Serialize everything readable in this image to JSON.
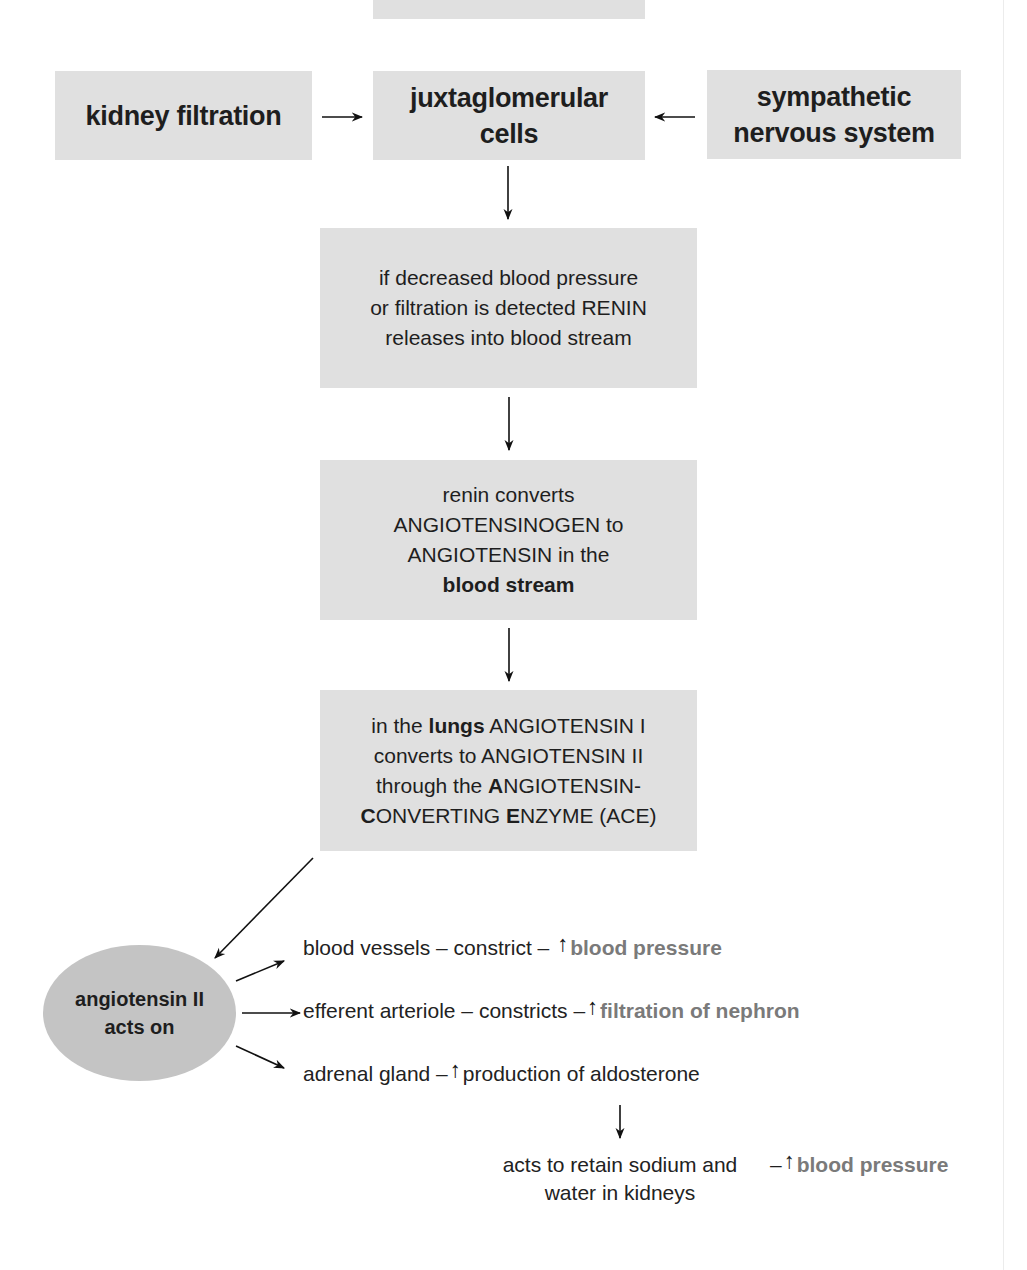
{
  "diagram": {
    "colors": {
      "box_fill": "#e0e0e0",
      "ellipse_fill": "#c4c4c4",
      "outcome_text": "#7a7a7a",
      "text": "#1e1e1e"
    },
    "top_partial_box": {
      "label": ""
    },
    "inputs": {
      "left": {
        "label": "kidney filtration"
      },
      "center": {
        "line1": "juxtaglomerular",
        "line2": "cells"
      },
      "right": {
        "line1": "sympathetic",
        "line2": "nervous system"
      }
    },
    "steps": [
      {
        "lines": [
          "if decreased blood pressure",
          "or filtration is detected RENIN",
          "releases into blood stream"
        ]
      },
      {
        "line1": "renin converts",
        "line2": "ANGIOTENSINOGEN to",
        "line3": "ANGIOTENSIN in the",
        "line4_bold": "blood stream"
      },
      {
        "l1_pre": "in the ",
        "l1_bold": "lungs",
        "l1_post": " ANGIOTENSIN I",
        "l2": "converts to ANGIOTENSIN II",
        "l3_pre": "through the ",
        "l3_bold": "A",
        "l3_post": "NGIOTENSIN-",
        "l4_bold1": "C",
        "l4_mid": "ONVERTING ",
        "l4_bold2": "E",
        "l4_post": "NZYME (ACE)"
      }
    ],
    "hub": {
      "line1": "angiotensin II",
      "line2": "acts on"
    },
    "effects": [
      {
        "target": "blood vessels – constrict  –",
        "arrow": "↑",
        "outcome": "blood pressure"
      },
      {
        "target": "efferent arteriole – constricts –",
        "arrow": "↑",
        "outcome": "filtration of nephron"
      },
      {
        "target": "adrenal gland –",
        "arrow": "↑",
        "outcome": "production of aldosterone"
      }
    ],
    "aldosterone_result": {
      "line1": "acts to retain sodium and",
      "line2": "water in kidneys",
      "dash": "–",
      "arrow": "↑",
      "outcome": "blood pressure"
    }
  }
}
